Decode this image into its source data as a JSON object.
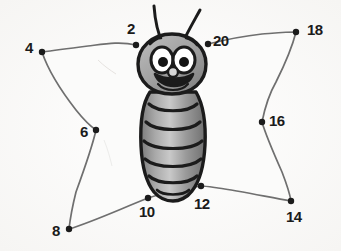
{
  "page": {
    "background_color": "#fefefe",
    "width": 341,
    "height": 251
  },
  "colors": {
    "ink": "#1b1b1b",
    "line": "#6b6b6b",
    "wing_fill": "#fbfbfa",
    "body_shade_light": "#b4b4b4",
    "body_shade_mid": "#8f8f8f",
    "body_shade_dark": "#6d6d6d",
    "eye_white": "#ffffff",
    "pupil": "#141414"
  },
  "figure": {
    "name": "smiling-caterpillar-butterfly"
  },
  "dots": [
    {
      "number": "2",
      "label": "2",
      "dot_x": 136,
      "dot_y": 45,
      "label_x": 127,
      "label_y": 21
    },
    {
      "number": "4",
      "label": "4",
      "dot_x": 42,
      "dot_y": 52,
      "label_x": 25,
      "label_y": 40
    },
    {
      "number": "6",
      "label": "6",
      "dot_x": 96,
      "dot_y": 130,
      "label_x": 80,
      "label_y": 124
    },
    {
      "number": "8",
      "label": "8",
      "dot_x": 69,
      "dot_y": 229,
      "label_x": 52,
      "label_y": 223
    },
    {
      "number": "10",
      "label": "10",
      "dot_x": 148,
      "dot_y": 198,
      "label_x": 139,
      "label_y": 204
    },
    {
      "number": "12",
      "label": "12",
      "dot_x": 201,
      "dot_y": 186,
      "label_x": 194,
      "label_y": 196
    },
    {
      "number": "14",
      "label": "14",
      "dot_x": 291,
      "dot_y": 201,
      "label_x": 286,
      "label_y": 209
    },
    {
      "number": "16",
      "label": "16",
      "dot_x": 262,
      "dot_y": 122,
      "label_x": 269,
      "label_y": 113
    },
    {
      "number": "18",
      "label": "18",
      "dot_x": 296,
      "dot_y": 32,
      "label_x": 307,
      "label_y": 22
    },
    {
      "number": "20",
      "label": "20",
      "dot_x": 208,
      "dot_y": 44,
      "label_x": 213,
      "label_y": 33
    }
  ],
  "paths": {
    "left_wing_outline": "M 136,45 C 120,41 104,44 88,46 C 72,48 56,50 42,52 C 48,70 62,92 76,110 C 84,120 90,126 96,130 C 92,148 84,170 76,192 C 72,208 70,220 69,229 C 92,222 118,210 148,198 C 166,192 186,188 201,186",
    "right_wing_outline": "M 208,44 C 224,40 244,36 262,34 C 276,33 288,32 296,32 C 292,48 284,66 276,82 C 268,96 264,112 262,122 C 266,136 274,154 282,172 C 287,185 290,195 291,201 C 268,197 240,191 218,188 C 211,187 205,186 201,186",
    "left_wing_fill": "M 136,45 C 120,41 104,44 88,46 C 72,48 56,50 42,52 C 48,70 62,92 76,110 C 84,120 90,126 96,130 C 92,148 84,170 76,192 C 72,208 70,220 69,229 C 92,222 118,210 148,198 C 166,192 186,188 201,186 C 190,150 178,100 172,60 Z",
    "right_wing_fill": "M 208,44 C 224,40 244,36 262,34 C 276,33 288,32 296,32 C 292,48 284,66 276,82 C 268,96 264,112 262,122 C 266,136 274,154 282,172 C 287,185 290,195 291,201 C 268,197 240,191 218,188 C 211,187 205,186 201,186 C 200,140 202,90 204,56 Z"
  },
  "body": {
    "antenna_left": "M 163,44 C 157,32 155,20 154,6",
    "antenna_right": "M 182,44 C 188,31 194,21 200,10",
    "head_outline": "M 172,34 C 192,34 206,48 206,64 C 206,82 192,94 172,94 C 152,94 138,82 138,64 C 138,48 152,34 172,34 Z",
    "segments": 6,
    "eye_left": {
      "cx": 162,
      "cy": 60,
      "rx": 11,
      "ry": 13
    },
    "eye_right": {
      "cx": 184,
      "cy": 60,
      "rx": 11,
      "ry": 13
    },
    "pupil_left": {
      "cx": 163,
      "cy": 62,
      "r": 5
    },
    "pupil_right": {
      "cx": 184,
      "cy": 62,
      "r": 5
    },
    "nose": {
      "cx": 173,
      "cy": 72,
      "rx": 5,
      "ry": 5
    },
    "mouth": "M 155,74 C 160,90 188,90 193,74 C 184,80 164,80 155,74 Z"
  }
}
